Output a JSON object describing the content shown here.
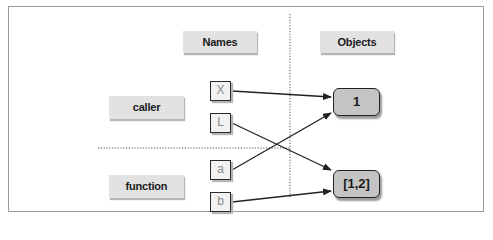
{
  "diagram": {
    "headers": {
      "names": "Names",
      "objects": "Objects"
    },
    "scopes": [
      {
        "label": "caller"
      },
      {
        "label": "function"
      }
    ],
    "names": [
      {
        "label": "X",
        "scope": "caller",
        "points_to": "1"
      },
      {
        "label": "L",
        "scope": "caller",
        "points_to": "[1,2]"
      },
      {
        "label": "a",
        "scope": "function",
        "points_to": "1"
      },
      {
        "label": "b",
        "scope": "function",
        "points_to": "[1,2]"
      }
    ],
    "objects": [
      {
        "label": "1"
      },
      {
        "label": "[1,2]"
      }
    ],
    "colors": {
      "label_bg": "#e2e2e2",
      "object_bg": "#c4c4c4",
      "name_box_bg": "#f2f2f2",
      "line": "#222222",
      "frame": "#9a9a9a"
    }
  }
}
